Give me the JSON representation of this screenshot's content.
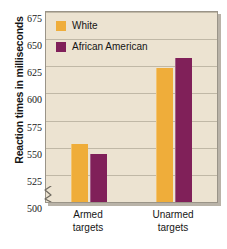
{
  "chart_data": {
    "type": "bar",
    "title": "",
    "subtitle": "",
    "xlabel": "",
    "ylabel": "Reaction times in milliseconds",
    "categories": [
      "Armed targets",
      "Unarmed targets"
    ],
    "category_lines": [
      [
        "Armed",
        "targets"
      ],
      [
        "Unarmed",
        "targets"
      ]
    ],
    "series": [
      {
        "name": "White",
        "color": "#efad3a",
        "values": [
          553,
          623
        ]
      },
      {
        "name": "African American",
        "color": "#802059",
        "values": [
          544,
          633
        ]
      }
    ],
    "ylim": [
      500,
      675
    ],
    "yticks": [
      500,
      525,
      550,
      575,
      600,
      625,
      650,
      675
    ],
    "ytick_labels": [
      "500",
      "525",
      "550",
      "575",
      "600",
      "625",
      "650",
      "675"
    ],
    "y_axis_break": true,
    "grid": true,
    "grid_axis": "y",
    "legend_position": "top-left",
    "plot_background": "#ece3d1",
    "legend": [
      {
        "label": "White",
        "color": "#efad3a"
      },
      {
        "label": "African American",
        "color": "#802059"
      }
    ]
  }
}
